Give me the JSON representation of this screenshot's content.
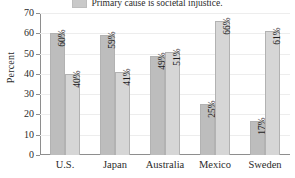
{
  "chart_data": {
    "type": "bar",
    "title": "",
    "subtitle": "",
    "xlabel": "",
    "ylabel": "Percent",
    "ylim": [
      0,
      70
    ],
    "yticks": [
      0,
      10,
      20,
      30,
      40,
      50,
      60,
      70
    ],
    "grid": true,
    "legend_position": "top-center",
    "categories": [
      "U.S.",
      "Japan",
      "Australia",
      "Mexico",
      "Sweden"
    ],
    "series": [
      {
        "name": "",
        "color": "#bdbdbd",
        "values": [
          60,
          59,
          49,
          25,
          17
        ],
        "labels": [
          "60%",
          "59%",
          "49%",
          "25%",
          "17%"
        ]
      },
      {
        "name": "Primary cause is societal injustice.",
        "color": "#d6d6d6",
        "values": [
          40,
          41,
          51,
          66,
          61
        ],
        "labels": [
          "40%",
          "41%",
          "51%",
          "66%",
          "61%"
        ]
      }
    ],
    "legend_entries": [
      {
        "label": "Primary cause is societal injustice.",
        "color": "#d6d6d6"
      }
    ]
  }
}
